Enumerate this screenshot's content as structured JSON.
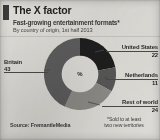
{
  "header": {
    "accent_color": "#3b3b3b",
    "title": "The X factor",
    "subtitle": "Fast-growing entertainment formats*",
    "subtitle2": "By country of origin, 1st half 2013"
  },
  "center_label": "%",
  "footer": {
    "source": "Source: FremantleMedia",
    "footnote_line1": "*Sold to at least",
    "footnote_line2": "two new territories"
  },
  "callouts": {
    "united_states": {
      "name": "United States",
      "value": "22"
    },
    "netherlands": {
      "name": "Netherlands",
      "value": "11"
    },
    "rest_of_world": {
      "name": "Rest of world",
      "value": "24"
    },
    "britain": {
      "name": "Britain",
      "value": "43"
    }
  },
  "chart_data": {
    "type": "pie",
    "title": "The X factor",
    "subtitle": "Fast-growing entertainment formats*",
    "xlabel": "",
    "ylabel": "",
    "unit": "%",
    "donut": true,
    "inner_radius_ratio": 0.52,
    "start_angle_deg": 0,
    "direction": "clockwise",
    "legend": "callout-labels",
    "grid": false,
    "categories": [
      "United States",
      "Netherlands",
      "Rest of world",
      "Britain"
    ],
    "values": [
      22,
      11,
      24,
      43
    ],
    "colors": [
      "#1e1e1e",
      "#575757",
      "#8d8b86",
      "#5d5d5d"
    ],
    "slices": [
      {
        "label": "United States",
        "value": 22,
        "color": "#1e1e1e"
      },
      {
        "label": "Netherlands",
        "value": 11,
        "color": "#575757"
      },
      {
        "label": "Rest of world",
        "value": 24,
        "color": "#8d8b86"
      },
      {
        "label": "Britain",
        "value": 43,
        "color": "#5d5d5d"
      }
    ],
    "annotations": [
      "*Sold to at least two new territories",
      "Source: FremantleMedia"
    ]
  }
}
